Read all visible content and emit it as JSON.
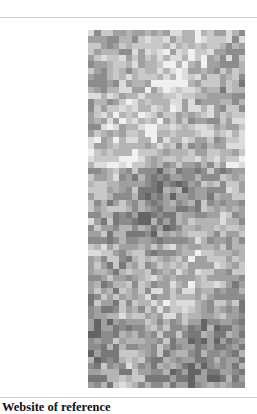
{
  "document": {
    "caption": "Website of reference"
  },
  "figure": {
    "type": "grayscale-pixel-grid",
    "columns": 25,
    "rows": 57,
    "palette": [
      "#f0f0f0",
      "#dcdcdc",
      "#c8c8c8",
      "#b4b4b4",
      "#a0a0a0",
      "#8c8c8c",
      "#787878",
      "#646464"
    ],
    "bands": [
      {
        "from_row": 0,
        "to_row": 10,
        "bias": 2.6
      },
      {
        "from_row": 10,
        "to_row": 22,
        "bias": 2.4
      },
      {
        "from_row": 22,
        "to_row": 34,
        "bias": 4.2
      },
      {
        "from_row": 34,
        "to_row": 46,
        "bias": 3.2
      },
      {
        "from_row": 46,
        "to_row": 57,
        "bias": 4.4
      }
    ],
    "seed": 7
  }
}
